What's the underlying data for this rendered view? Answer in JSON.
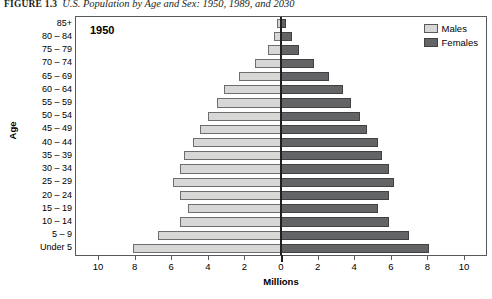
{
  "caption": {
    "figure_number": "FIGURE 1.3",
    "text": "U.S. Population by Age and Sex: 1950, 1989, and 2030"
  },
  "panel": {
    "note": "1950"
  },
  "legend": {
    "position": "top-right",
    "items": [
      {
        "label": "Males",
        "color": "#d7d8d6"
      },
      {
        "label": "Females",
        "color": "#636466"
      }
    ]
  },
  "axes": {
    "y_title": "Age",
    "x_title": "Millions",
    "x_ticks": [
      "10",
      "8",
      "6",
      "4",
      "2",
      "0",
      "2",
      "4",
      "6",
      "8",
      "10"
    ],
    "x_tick_values": [
      -10,
      -8,
      -6,
      -4,
      -2,
      0,
      2,
      4,
      6,
      8,
      10
    ],
    "x_range": [
      -11.2,
      11.2
    ]
  },
  "chart_data": {
    "type": "bar",
    "subtype": "population-pyramid",
    "title": "U.S. Population by Age and Sex: 1950, 1989, and 2030",
    "annotation": "1950",
    "xlabel": "Millions",
    "ylabel": "Age",
    "xlim": [
      -11.2,
      11.2
    ],
    "grid": false,
    "legend_position": "top-right",
    "categories": [
      "85+",
      "80 – 84",
      "75 – 79",
      "70 – 74",
      "65 – 69",
      "60 – 64",
      "55 – 59",
      "50 – 54",
      "45 – 49",
      "40 – 44",
      "35 – 39",
      "30 – 34",
      "25 – 29",
      "20 – 24",
      "15 – 19",
      "10 – 14",
      "5 – 9",
      "Under 5"
    ],
    "series": [
      {
        "name": "Males",
        "direction": "left",
        "color": "#d7d8d6",
        "values": [
          0.2,
          0.4,
          0.7,
          1.4,
          2.3,
          3.1,
          3.5,
          4.0,
          4.4,
          4.8,
          5.3,
          5.5,
          5.9,
          5.5,
          5.1,
          5.5,
          6.7,
          8.1
        ]
      },
      {
        "name": "Females",
        "direction": "right",
        "color": "#636466",
        "values": [
          0.3,
          0.6,
          1.0,
          1.8,
          2.6,
          3.4,
          3.8,
          4.3,
          4.7,
          5.3,
          5.5,
          5.9,
          6.2,
          5.9,
          5.3,
          5.9,
          7.0,
          8.1
        ]
      }
    ]
  }
}
